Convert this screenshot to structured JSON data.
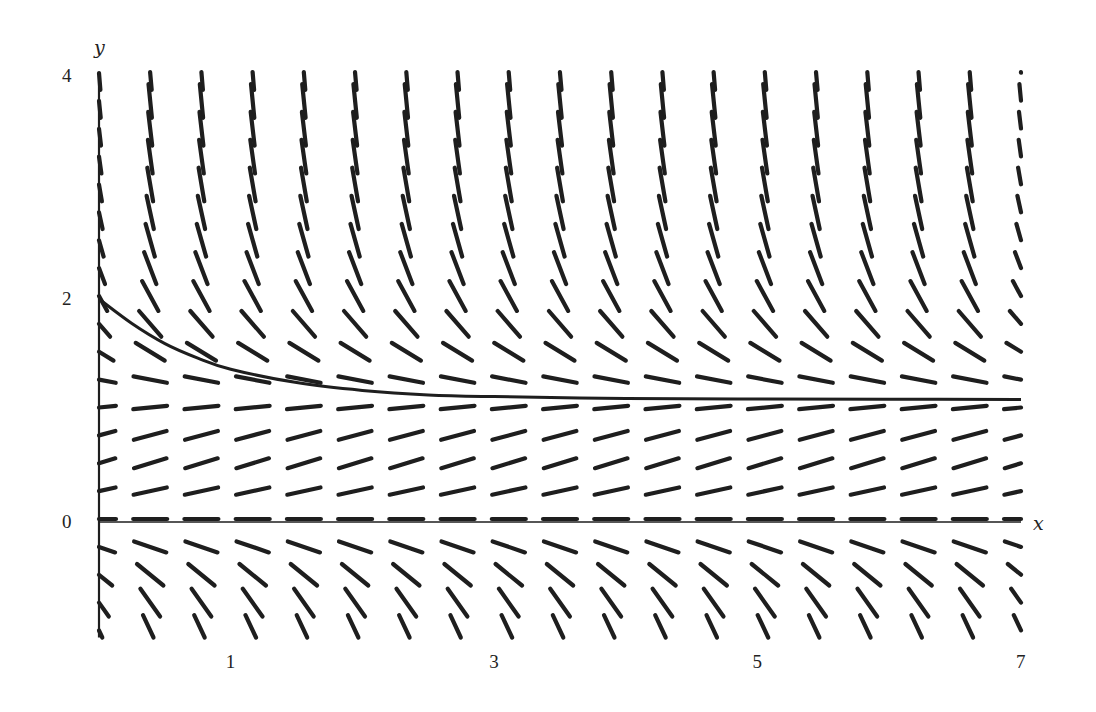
{
  "chart_data": {
    "type": "slope_field",
    "title": "",
    "xlabel": "x",
    "ylabel": "y",
    "xlim": [
      0,
      7
    ],
    "ylim": [
      -1,
      4
    ],
    "grid": false,
    "x_ticks": [
      {
        "value": 1,
        "label": "1"
      },
      {
        "value": 3,
        "label": "3"
      },
      {
        "value": 5,
        "label": "5"
      },
      {
        "value": 7,
        "label": "7"
      }
    ],
    "y_ticks": [
      {
        "value": 0,
        "label": "0"
      },
      {
        "value": 2,
        "label": "2"
      },
      {
        "value": 4,
        "label": "4"
      }
    ],
    "field": {
      "description": "Direction field for dy/dx = k*y*(c - y)",
      "k": 1.2,
      "c": 1.1,
      "x_start": 0,
      "x_step": 0.3889,
      "x_count": 19,
      "y_start": 4,
      "y_step": -0.25,
      "y_count": 21,
      "dash_length_px": 34
    },
    "equilibria": [
      0,
      1.1
    ],
    "solution_curve": {
      "label": "solution through (0, 2)",
      "initial_point": [
        0,
        2
      ],
      "asymptote": 1.1,
      "points": [
        [
          0,
          2.0
        ],
        [
          0.25,
          1.78
        ],
        [
          0.5,
          1.6
        ],
        [
          0.75,
          1.47
        ],
        [
          1.0,
          1.37
        ],
        [
          1.5,
          1.25
        ],
        [
          2.0,
          1.18
        ],
        [
          2.5,
          1.14
        ],
        [
          3.0,
          1.125
        ],
        [
          4.0,
          1.108
        ],
        [
          5.0,
          1.103
        ],
        [
          6.0,
          1.101
        ],
        [
          7.0,
          1.1
        ]
      ]
    }
  },
  "axes": {
    "x_axis_label": "x",
    "y_axis_label": "y"
  },
  "colors": {
    "ink": "#1e1e1e",
    "background": "#ffffff"
  }
}
